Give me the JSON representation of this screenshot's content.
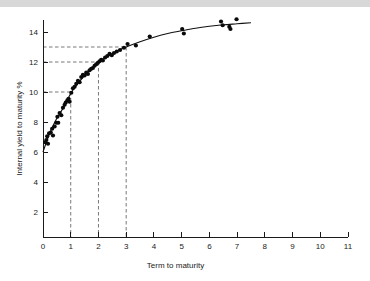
{
  "figure": {
    "background_color": "#ffffff",
    "top_band_color": "#d8d8d8",
    "point_color": "#0a0a0a",
    "curve_color": "#111111",
    "guide_color": "#555555"
  },
  "chart_data": {
    "type": "scatter",
    "title": "",
    "subtitle": "",
    "xlabel": "Term to maturity",
    "ylabel": "Internal yield to maturity %",
    "xlim": [
      0,
      11
    ],
    "ylim": [
      0,
      15.2
    ],
    "xticks": [
      0,
      1,
      2,
      3,
      4,
      5,
      6,
      7,
      8,
      9,
      10,
      11
    ],
    "xticklabels": [
      "0",
      "1",
      "2",
      "3",
      "4",
      "5",
      "6",
      "7",
      "8",
      "9",
      "10",
      "11"
    ],
    "yticks": [
      2,
      4,
      6,
      8,
      10,
      12,
      14
    ],
    "yticklabels": [
      "2",
      "4",
      "6",
      "8",
      "10",
      "12",
      "14"
    ],
    "grid": false,
    "legend": null,
    "legend_position": "none",
    "series": [
      {
        "name": "Bond observations",
        "marker": "filled-circle",
        "points": [
          [
            0.08,
            6.65
          ],
          [
            0.12,
            6.8
          ],
          [
            0.15,
            7.05
          ],
          [
            0.18,
            6.55
          ],
          [
            0.22,
            7.25
          ],
          [
            0.28,
            7.3
          ],
          [
            0.33,
            7.55
          ],
          [
            0.36,
            7.1
          ],
          [
            0.42,
            7.7
          ],
          [
            0.48,
            7.95
          ],
          [
            0.52,
            8.35
          ],
          [
            0.55,
            7.95
          ],
          [
            0.6,
            8.6
          ],
          [
            0.66,
            8.45
          ],
          [
            0.72,
            8.95
          ],
          [
            0.78,
            9.15
          ],
          [
            0.82,
            9.3
          ],
          [
            0.88,
            9.45
          ],
          [
            0.92,
            9.55
          ],
          [
            0.96,
            9.35
          ],
          [
            1.02,
            9.95
          ],
          [
            1.08,
            10.25
          ],
          [
            1.14,
            10.35
          ],
          [
            1.2,
            10.55
          ],
          [
            1.26,
            10.75
          ],
          [
            1.32,
            10.65
          ],
          [
            1.38,
            11.0
          ],
          [
            1.44,
            11.15
          ],
          [
            1.5,
            11.1
          ],
          [
            1.56,
            11.3
          ],
          [
            1.62,
            11.2
          ],
          [
            1.68,
            11.45
          ],
          [
            1.74,
            11.55
          ],
          [
            1.8,
            11.6
          ],
          [
            1.86,
            11.75
          ],
          [
            1.92,
            11.85
          ],
          [
            1.98,
            11.95
          ],
          [
            2.04,
            12.05
          ],
          [
            2.1,
            12.15
          ],
          [
            2.16,
            12.1
          ],
          [
            2.24,
            12.3
          ],
          [
            2.32,
            12.4
          ],
          [
            2.4,
            12.55
          ],
          [
            2.48,
            12.45
          ],
          [
            2.56,
            12.6
          ],
          [
            2.66,
            12.7
          ],
          [
            2.78,
            12.8
          ],
          [
            2.92,
            12.95
          ],
          [
            3.05,
            13.2
          ],
          [
            3.35,
            13.1
          ],
          [
            3.85,
            13.7
          ],
          [
            5.02,
            14.2
          ],
          [
            5.08,
            13.9
          ],
          [
            6.42,
            14.7
          ],
          [
            6.48,
            14.45
          ],
          [
            6.72,
            14.35
          ],
          [
            6.76,
            14.2
          ],
          [
            6.98,
            14.85
          ]
        ]
      }
    ],
    "fit_curve": {
      "name": "Yield curve fit",
      "description": "Smooth logarithmic yield curve through scatter",
      "points": [
        [
          0.0,
          6.0
        ],
        [
          0.25,
          7.3
        ],
        [
          0.5,
          8.25
        ],
        [
          0.75,
          9.0
        ],
        [
          1.0,
          9.9
        ],
        [
          1.25,
          10.55
        ],
        [
          1.5,
          11.1
        ],
        [
          1.75,
          11.55
        ],
        [
          2.0,
          11.95
        ],
        [
          2.25,
          12.3
        ],
        [
          2.5,
          12.55
        ],
        [
          2.75,
          12.8
        ],
        [
          3.0,
          13.0
        ],
        [
          3.5,
          13.35
        ],
        [
          4.0,
          13.65
        ],
        [
          4.5,
          13.9
        ],
        [
          5.0,
          14.08
        ],
        [
          5.5,
          14.25
        ],
        [
          6.0,
          14.38
        ],
        [
          6.5,
          14.48
        ],
        [
          7.0,
          14.55
        ],
        [
          7.5,
          14.62
        ]
      ]
    },
    "reference_lines": [
      {
        "label": "yield-13-at-term-3",
        "x": 3,
        "y": 13
      },
      {
        "label": "yield-12-at-term-2",
        "x": 2,
        "y": 12
      },
      {
        "label": "yield-10-at-term-1",
        "x": 1,
        "y": 10
      }
    ]
  }
}
